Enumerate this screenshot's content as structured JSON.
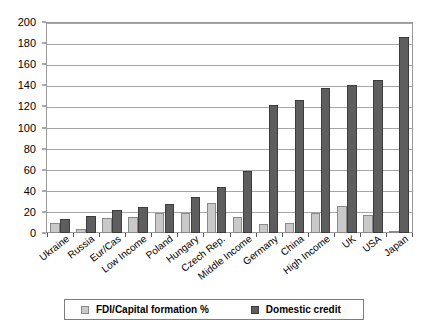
{
  "chart_data": {
    "type": "bar",
    "title": "",
    "subtitle": "",
    "xlabel": "",
    "ylabel": "",
    "ylim": [
      0,
      200
    ],
    "ytick_step": 20,
    "yticks": [
      0,
      20,
      40,
      60,
      80,
      100,
      120,
      140,
      160,
      180,
      200
    ],
    "grid": true,
    "legend_position": "bottom",
    "categories": [
      "Ukraine",
      "Russia",
      "Eur/Cas",
      "Low Income",
      "Poland",
      "Hungary",
      "Czech Rep.",
      "Middle Income",
      "Germany",
      "China",
      "High Income",
      "UK",
      "USA",
      "Japan"
    ],
    "series": [
      {
        "name": "FDI/Capital formation %",
        "color": "#c9c9c9",
        "values": [
          10,
          4,
          14,
          15,
          19,
          19,
          29,
          15,
          9,
          10,
          19,
          26,
          17,
          1
        ]
      },
      {
        "name": "Domestic credit",
        "color": "#5e5e5e",
        "values": [
          13,
          16,
          22,
          25,
          28,
          34,
          44,
          59,
          122,
          127,
          138,
          141,
          146,
          187
        ]
      }
    ]
  },
  "legend": {
    "entries": [
      {
        "label": "FDI/Capital formation %",
        "swatch": "light"
      },
      {
        "label": "Domestic credit",
        "swatch": "dark"
      }
    ]
  },
  "colors": {
    "series_light": "#c9c9c9",
    "series_dark": "#5e5e5e",
    "gridline": "#a6a6a6",
    "axis": "#555555",
    "background": "#ffffff"
  }
}
